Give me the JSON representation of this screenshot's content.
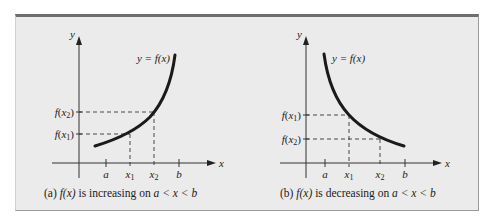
{
  "colors": {
    "background": "#ebebeb",
    "curve": "#1a1a1a",
    "axis": "#333333",
    "frame_top": "#6e6e6e"
  },
  "panels": [
    {
      "id": "a",
      "curve_label": "y = f(x)",
      "y_axis_label": "y",
      "x_axis_label": "x",
      "x_ticks": [
        "a",
        "x1",
        "x2",
        "b"
      ],
      "y_ticks": [
        "f(x2)",
        "f(x1)"
      ],
      "caption_prefix": "(a) ",
      "caption_fx": "f(x)",
      "caption_mid": " is increasing on ",
      "caption_range": "a < x < b"
    },
    {
      "id": "b",
      "curve_label": "y = f(x)",
      "y_axis_label": "y",
      "x_axis_label": "x",
      "x_ticks": [
        "a",
        "x1",
        "x2",
        "b"
      ],
      "y_ticks": [
        "f(x1)",
        "f(x2)"
      ],
      "caption_prefix": "(b) ",
      "caption_fx": "f(x)",
      "caption_mid": " is decreasing on ",
      "caption_range": "a < x < b"
    }
  ]
}
